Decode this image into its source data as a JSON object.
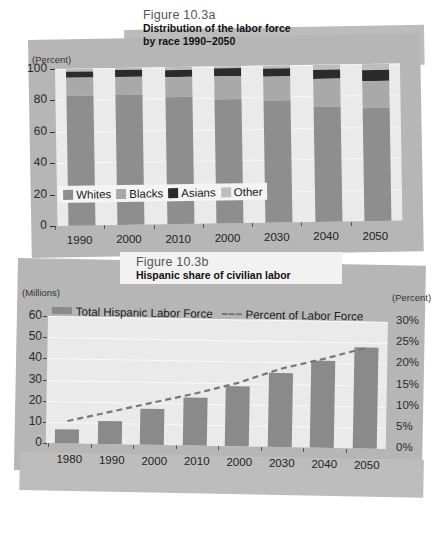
{
  "figure_a": {
    "number": "Figure 10.3a",
    "title_line1": "Distribution of the labor force",
    "title_line2": "by race 1990–2050",
    "y_axis_label": "(Percent)",
    "legend": [
      {
        "label": "Whites",
        "color": "#8e8e8e"
      },
      {
        "label": "Blacks",
        "color": "#a9a9a9"
      },
      {
        "label": "Asians",
        "color": "#2b2b2b"
      },
      {
        "label": "Other",
        "color": "#bdbdbd"
      }
    ]
  },
  "figure_b": {
    "number": "Figure 10.3b",
    "title_line1": "Hispanic share of civilian labor",
    "y_axis_label_left": "(Millions)",
    "y_axis_label_right": "(Percent)",
    "legend": [
      {
        "label": "Total Hispanic Labor Force",
        "marker": "bar",
        "color": "#8a8a8a"
      },
      {
        "label": "Percent of Labor Force",
        "marker": "dashed-line",
        "color": "#777777"
      }
    ]
  },
  "chart_data": [
    {
      "type": "bar",
      "id": "figure-10-3a",
      "title": "Distribution of the labor force by race 1990–2050",
      "subtitle": "Figure 10.3a",
      "stacked": true,
      "xlabel": "",
      "ylabel": "(Percent)",
      "ylim": [
        0,
        100
      ],
      "yticks": [
        0,
        20,
        40,
        60,
        80,
        100
      ],
      "ytick_labels": [
        "0",
        "20",
        "40",
        "60",
        "80",
        "100"
      ],
      "grid": true,
      "legend_position": "inside-bottom-left",
      "categories": [
        "1990",
        "2000",
        "2010",
        "2000",
        "2030",
        "2040",
        "2050"
      ],
      "series": [
        {
          "name": "Whites",
          "color": "#8e8e8e",
          "values": [
            83,
            83,
            81,
            79,
            77.5,
            73,
            72
          ]
        },
        {
          "name": "Blacks",
          "color": "#a9a9a9",
          "values": [
            11,
            11.5,
            12.5,
            14.5,
            15.5,
            18,
            17
          ]
        },
        {
          "name": "Asians",
          "color": "#2b2b2b",
          "values": [
            4,
            4,
            4.5,
            5,
            5,
            6,
            7
          ]
        },
        {
          "name": "Other",
          "color": "#bdbdbd",
          "values": [
            2,
            1.5,
            2,
            1.5,
            2,
            3,
            4
          ]
        }
      ]
    },
    {
      "type": "bar",
      "id": "figure-10-3b",
      "title": "Hispanic share of civilian labor",
      "subtitle": "Figure 10.3b",
      "xlabel": "",
      "ylabel": "(Millions)",
      "ylabel_right": "(Percent)",
      "ylim": [
        0,
        60
      ],
      "yticks": [
        0,
        10,
        20,
        30,
        40,
        50,
        60
      ],
      "ytick_labels": [
        "0",
        "10",
        "20",
        "30",
        "40",
        "50",
        "60"
      ],
      "ylim_right": [
        0,
        30
      ],
      "yticks_right": [
        0,
        5,
        10,
        15,
        20,
        25,
        30
      ],
      "ytick_labels_right": [
        "0%",
        "5%",
        "10%",
        "15%",
        "20%",
        "25%",
        "30%"
      ],
      "grid": true,
      "legend_position": "top-left",
      "categories": [
        "1980",
        "1990",
        "2000",
        "2010",
        "2000",
        "2030",
        "2040",
        "2050"
      ],
      "series": [
        {
          "name": "Total Hispanic Labor Force",
          "type": "bar",
          "axis": "left",
          "color": "#8a8a8a",
          "values": [
            6.5,
            11,
            17,
            22.5,
            28.5,
            35,
            41,
            47.5
          ]
        },
        {
          "name": "Percent of Labor Force",
          "type": "line",
          "style": "dashed",
          "axis": "right",
          "color": "#777777",
          "values": [
            5.3,
            7.6,
            10.0,
            12.3,
            15.0,
            18.5,
            21.0,
            23.8
          ]
        }
      ]
    }
  ]
}
